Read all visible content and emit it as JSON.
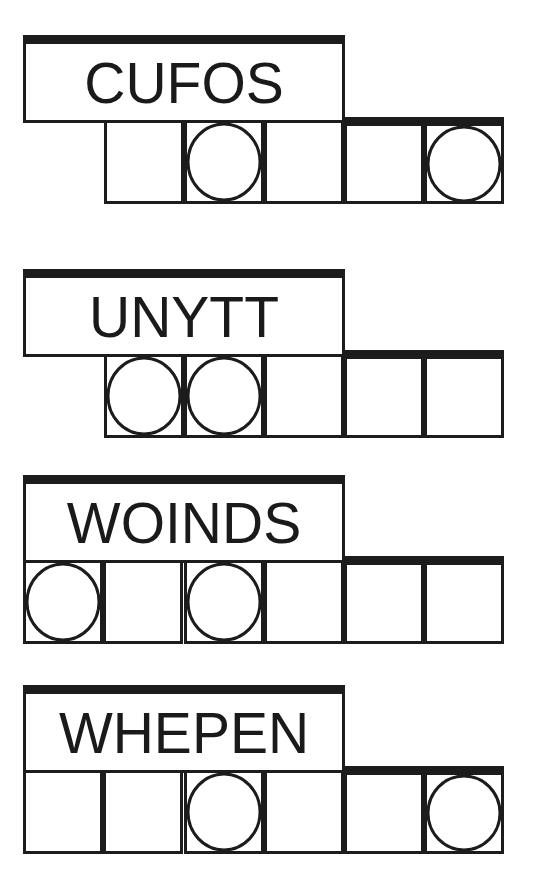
{
  "puzzles": [
    {
      "scrambled": "CUFOS",
      "cells": [
        {
          "circled": false
        },
        {
          "circled": true
        },
        {
          "circled": false
        },
        {
          "circled": false
        },
        {
          "circled": true
        }
      ]
    },
    {
      "scrambled": "UNYTT",
      "cells": [
        {
          "circled": true
        },
        {
          "circled": true
        },
        {
          "circled": false
        },
        {
          "circled": false
        },
        {
          "circled": false
        }
      ]
    },
    {
      "scrambled": "WOINDS",
      "cells": [
        {
          "circled": true
        },
        {
          "circled": false
        },
        {
          "circled": true
        },
        {
          "circled": false
        },
        {
          "circled": false
        },
        {
          "circled": false
        }
      ]
    },
    {
      "scrambled": "WHEPEN",
      "cells": [
        {
          "circled": false
        },
        {
          "circled": false
        },
        {
          "circled": true
        },
        {
          "circled": false
        },
        {
          "circled": false
        },
        {
          "circled": true
        }
      ]
    }
  ],
  "colors": {
    "ink": "#1c1c1c",
    "background": "#ffffff"
  }
}
